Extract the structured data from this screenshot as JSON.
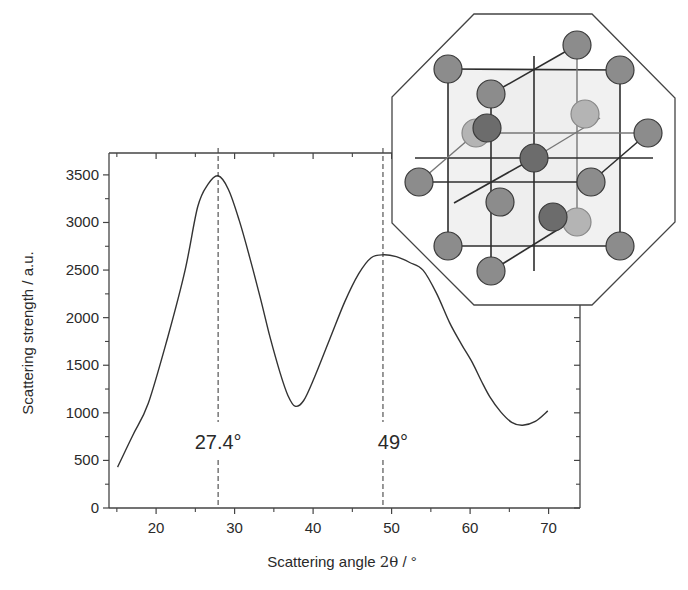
{
  "chart_data": {
    "type": "line",
    "title": "",
    "xlabel": "Scattering angle 2θ / °",
    "xlabel_parts": {
      "prefix": "Scattering angle ",
      "symbol": "2θ",
      "suffix": " / °"
    },
    "ylabel": "Scattering strength / a.u.",
    "xlim": [
      14,
      74
    ],
    "ylim": [
      0,
      3730
    ],
    "xticks": [
      20,
      30,
      40,
      50,
      60,
      70
    ],
    "xtick_labels": [
      "20",
      "30",
      "40",
      "50",
      "60",
      "70"
    ],
    "x_minor_ticks": [
      15,
      25,
      35,
      45,
      55,
      65
    ],
    "yticks": [
      0,
      500,
      1000,
      1500,
      2000,
      2500,
      3000,
      3500
    ],
    "ytick_labels": [
      "0",
      "500",
      "1000",
      "1500",
      "2000",
      "2500",
      "3000",
      "3500"
    ],
    "y_minor_ticks": [
      250,
      750,
      1250,
      1750,
      2250,
      2750,
      3250
    ],
    "grid": false,
    "legend": "none",
    "series": [
      {
        "name": "Scattering strength",
        "color": "#333333",
        "x": [
          15.1,
          17,
          19,
          21.5,
          23.7,
          25.3,
          26.6,
          27.9,
          29.2,
          30.6,
          32,
          33.3,
          34.5,
          35.8,
          36.8,
          37.7,
          38.8,
          40.2,
          42.1,
          44,
          45.8,
          47.4,
          49.0,
          50.6,
          52.3,
          54,
          55.7,
          57.4,
          58.9,
          60.3,
          61.4,
          62.5,
          63.9,
          65.3,
          66.7,
          68.3,
          69.9
        ],
        "y": [
          430,
          760,
          1100,
          1800,
          2500,
          3165,
          3400,
          3490,
          3350,
          3020,
          2610,
          2200,
          1800,
          1420,
          1180,
          1070,
          1130,
          1380,
          1770,
          2160,
          2460,
          2630,
          2660,
          2640,
          2580,
          2500,
          2260,
          1945,
          1720,
          1525,
          1340,
          1170,
          1010,
          900,
          870,
          910,
          1020
        ]
      }
    ],
    "annotations": [
      {
        "label": "27.4°",
        "x": 27.9,
        "type": "vertical-dashed-line"
      },
      {
        "label": "49°",
        "x": 48.9,
        "type": "vertical-dashed-line"
      }
    ],
    "inset": {
      "description": "crystal lattice unit cell diagram in octagonal frame",
      "atom_colors": {
        "normal": "#8c8c8c",
        "dark": "#6c6c6c",
        "light": "#b4b4b4",
        "outline": "#3a3a3a"
      }
    }
  }
}
